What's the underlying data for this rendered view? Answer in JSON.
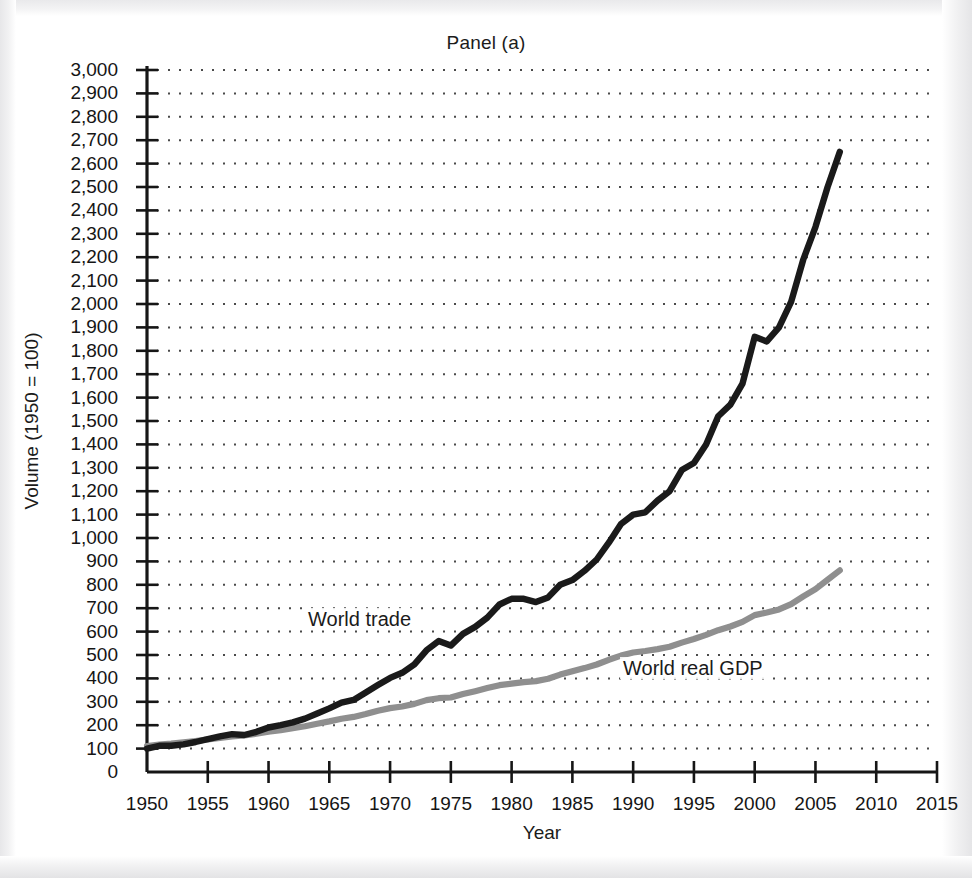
{
  "figure": {
    "title": "Panel (a)",
    "xlabel": "Year",
    "ylabel": "Volume (1950 = 100)"
  },
  "annotations": {
    "world_trade": "World trade",
    "world_real_gdp": "World real GDP"
  },
  "colors": {
    "world_trade": "#1a1a1a",
    "world_real_gdp": "#8f8f8f",
    "axis": "#161616",
    "grid": "#4a4a4a",
    "background": "#ffffff"
  },
  "chart_data": {
    "type": "line",
    "title": "Panel (a)",
    "xlabel": "Year",
    "ylabel": "Volume (1950 = 100)",
    "xlim": [
      1950,
      2015
    ],
    "ylim": [
      0,
      3000
    ],
    "xtick_step": 5,
    "ytick_step": 100,
    "grid": true,
    "grid_style": "dotted horizontal",
    "legend": "inline annotations on curves",
    "xticks": [
      "1950",
      "1955",
      "1960",
      "1965",
      "1970",
      "1975",
      "1980",
      "1985",
      "1990",
      "1995",
      "2000",
      "2005",
      "2010",
      "2015"
    ],
    "yticks": [
      "0",
      "100",
      "200",
      "300",
      "400",
      "500",
      "600",
      "700",
      "800",
      "900",
      "1,000",
      "1,100",
      "1,200",
      "1,300",
      "1,400",
      "1,500",
      "1,600",
      "1,700",
      "1,800",
      "1,900",
      "2,000",
      "2,100",
      "2,200",
      "2,300",
      "2,400",
      "2,500",
      "2,600",
      "2,700",
      "2,800",
      "2,900",
      "3,000"
    ],
    "x": [
      1950,
      1951,
      1952,
      1953,
      1954,
      1955,
      1956,
      1957,
      1958,
      1959,
      1960,
      1961,
      1962,
      1963,
      1964,
      1965,
      1966,
      1967,
      1968,
      1969,
      1970,
      1971,
      1972,
      1973,
      1974,
      1975,
      1976,
      1977,
      1978,
      1979,
      1980,
      1981,
      1982,
      1983,
      1984,
      1985,
      1986,
      1987,
      1988,
      1989,
      1990,
      1991,
      1992,
      1993,
      1994,
      1995,
      1996,
      1997,
      1998,
      1999,
      2000,
      2001,
      2002,
      2003,
      2004,
      2005,
      2006,
      2007
    ],
    "series": [
      {
        "name": "World trade",
        "color": "#1a1a1a",
        "values": [
          100,
          112,
          112,
          118,
          128,
          140,
          152,
          162,
          158,
          172,
          190,
          200,
          212,
          228,
          250,
          272,
          296,
          308,
          340,
          372,
          402,
          424,
          460,
          520,
          560,
          540,
          590,
          620,
          660,
          716,
          740,
          740,
          726,
          746,
          800,
          820,
          860,
          908,
          980,
          1060,
          1100,
          1110,
          1160,
          1200,
          1290,
          1320,
          1400,
          1520,
          1570,
          1660,
          1860,
          1840,
          1900,
          2010,
          2190,
          2330,
          2500,
          2650
        ]
      },
      {
        "name": "World real GDP",
        "color": "#8f8f8f",
        "values": [
          100,
          105,
          109,
          114,
          119,
          126,
          131,
          137,
          141,
          147,
          155,
          161,
          169,
          176,
          186,
          195,
          205,
          212,
          223,
          236,
          246,
          252,
          262,
          277,
          284,
          287,
          300,
          311,
          323,
          334,
          340,
          346,
          350,
          359,
          375,
          388,
          400,
          414,
          432,
          448,
          460,
          466,
          473,
          482,
          498,
          512,
          528,
          546,
          560,
          578,
          604,
          614,
          626,
          646,
          676,
          704,
          740,
          776
        ]
      }
    ],
    "notable_features": [
      "World trade dips from about 560 in 1974 to 540 in 1975",
      "World trade plateaus near 740 from 1980 to 1983",
      "World trade plateaus near 1,100-1,110 around 1990-1991",
      "World trade plateaus near 1,860-1,840 around 2000-2001",
      "Both series begin at 100 in 1950",
      "World trade reaches about 2,650 and world real GDP about 860 at the end of the sample"
    ]
  },
  "rendering": {
    "plot_left_px": 147,
    "plot_right_px": 937,
    "plot_top_px": 70,
    "plot_bottom_px": 772,
    "year_min": 1950,
    "year_max": 2015,
    "value_min": 0,
    "value_max": 3000,
    "gdp_scale_display": 1.11
  }
}
